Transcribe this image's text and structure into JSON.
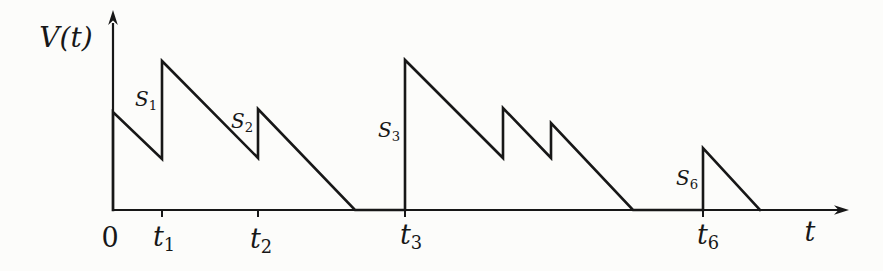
{
  "figure": {
    "width": 883,
    "height": 271,
    "background": "#fcfcfa",
    "line_color": "#171717",
    "line_width": 2.6
  },
  "chart_data": {
    "type": "line",
    "title": "",
    "xlabel": "t",
    "ylabel": "V(t)",
    "grid": false,
    "legend": "none",
    "x_axis_px": {
      "x_left": 113,
      "x_right": 841,
      "y": 210,
      "arrow_tip_x": 849
    },
    "y_axis_px": {
      "x": 113,
      "y_bottom": 211,
      "y_top": 23,
      "arrow_tip_y": 10
    },
    "path_px": [
      [
        113,
        210
      ],
      [
        113,
        112
      ],
      [
        162,
        159
      ],
      [
        162,
        61
      ],
      [
        258,
        158
      ],
      [
        258,
        109
      ],
      [
        355,
        210
      ],
      [
        405,
        210
      ],
      [
        405,
        60
      ],
      [
        503,
        158
      ],
      [
        503,
        108
      ],
      [
        551,
        158
      ],
      [
        551,
        123
      ],
      [
        633,
        210
      ],
      [
        703,
        210
      ],
      [
        703,
        148
      ],
      [
        760,
        210
      ]
    ],
    "x_ticks_px": [
      162,
      258,
      405,
      703
    ],
    "tick_length": 7,
    "labels": [
      {
        "id": "y-axis-title",
        "text": "V(t)",
        "sub": "",
        "italic": true,
        "x": 66,
        "y": 38,
        "size": 28
      },
      {
        "id": "tick-0",
        "text": "0",
        "sub": "",
        "italic": false,
        "x": 110,
        "y": 237,
        "size": 27
      },
      {
        "id": "tick-t1",
        "text": "t",
        "sub": "1",
        "italic": true,
        "x": 164,
        "y": 236,
        "size": 27
      },
      {
        "id": "tick-t2",
        "text": "t",
        "sub": "2",
        "italic": true,
        "x": 261,
        "y": 238,
        "size": 27
      },
      {
        "id": "tick-t3",
        "text": "t",
        "sub": "3",
        "italic": true,
        "x": 411,
        "y": 234,
        "size": 27
      },
      {
        "id": "tick-t6",
        "text": "t",
        "sub": "6",
        "italic": true,
        "x": 708,
        "y": 234,
        "size": 27
      },
      {
        "id": "x-axis-title",
        "text": "t",
        "sub": "",
        "italic": true,
        "x": 810,
        "y": 231,
        "size": 27
      },
      {
        "id": "jump-S1",
        "text": "S",
        "sub": "1",
        "italic": true,
        "x": 146,
        "y": 99,
        "size": 20
      },
      {
        "id": "jump-S2",
        "text": "S",
        "sub": "2",
        "italic": true,
        "x": 242,
        "y": 121,
        "size": 20
      },
      {
        "id": "jump-S3",
        "text": "S",
        "sub": "3",
        "italic": true,
        "x": 389,
        "y": 130,
        "size": 20
      },
      {
        "id": "jump-S6",
        "text": "S",
        "sub": "6",
        "italic": true,
        "x": 687,
        "y": 178,
        "size": 20
      }
    ]
  }
}
